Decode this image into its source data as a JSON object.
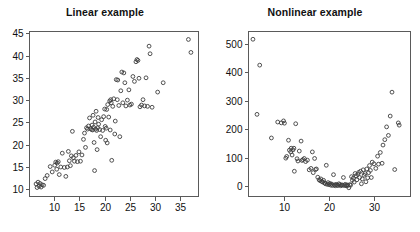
{
  "figure": {
    "width": 420,
    "height": 232,
    "background": "#ffffff",
    "marker_color": "#3d3d3d",
    "axis_color": "#5a5a5a",
    "text_color": "#111111"
  },
  "panels": [
    {
      "id": "linear",
      "title": "Linear example"
    },
    {
      "id": "nonlinear",
      "title": "Nonlinear example"
    }
  ],
  "chart_data": [
    {
      "type": "scatter",
      "title": "Linear example",
      "xlabel": "",
      "ylabel": "",
      "marker": "open-circle",
      "grid": false,
      "legend": null,
      "xlim": [
        5.0,
        38.5
      ],
      "ylim": [
        8.5,
        45.5
      ],
      "xticks": [
        10,
        15,
        20,
        25,
        30,
        35
      ],
      "yticks": [
        10,
        15,
        20,
        25,
        30,
        35,
        40,
        45
      ],
      "xtick_labels": [
        "10",
        "15",
        "20",
        "25",
        "30",
        "35"
      ],
      "ytick_labels": [
        "10",
        "15",
        "20",
        "25",
        "30",
        "35",
        "40",
        "45"
      ],
      "points": [
        [
          6.4,
          11.2
        ],
        [
          6.6,
          10.4
        ],
        [
          6.8,
          11.6
        ],
        [
          7.0,
          10.7
        ],
        [
          7.2,
          11.3
        ],
        [
          7.4,
          10.5
        ],
        [
          7.6,
          11.0
        ],
        [
          7.9,
          10.9
        ],
        [
          8.2,
          12.4
        ],
        [
          8.6,
          13.1
        ],
        [
          9.2,
          15.1
        ],
        [
          9.6,
          13.9
        ],
        [
          10.1,
          15.4
        ],
        [
          10.3,
          16.1
        ],
        [
          10.5,
          14.5
        ],
        [
          10.6,
          15.9
        ],
        [
          10.8,
          16.2
        ],
        [
          11.0,
          13.3
        ],
        [
          11.3,
          15.0
        ],
        [
          11.6,
          18.1
        ],
        [
          12.0,
          14.9
        ],
        [
          12.3,
          12.9
        ],
        [
          12.6,
          15.0
        ],
        [
          12.8,
          18.5
        ],
        [
          13.0,
          16.4
        ],
        [
          13.2,
          15.3
        ],
        [
          13.4,
          17.5
        ],
        [
          13.6,
          23.0
        ],
        [
          13.8,
          17.1
        ],
        [
          14.0,
          16.3
        ],
        [
          14.3,
          17.6
        ],
        [
          14.6,
          16.2
        ],
        [
          14.9,
          18.4
        ],
        [
          15.2,
          16.3
        ],
        [
          15.5,
          17.7
        ],
        [
          15.8,
          21.2
        ],
        [
          16.0,
          22.6
        ],
        [
          16.2,
          19.4
        ],
        [
          16.4,
          23.8
        ],
        [
          16.6,
          23.5
        ],
        [
          16.8,
          24.2
        ],
        [
          17.0,
          26.0
        ],
        [
          17.2,
          23.6
        ],
        [
          17.4,
          23.4
        ],
        [
          17.5,
          24.4
        ],
        [
          17.6,
          23.3
        ],
        [
          17.7,
          26.6
        ],
        [
          17.8,
          23.9
        ],
        [
          17.9,
          20.5
        ],
        [
          18.0,
          14.2
        ],
        [
          18.1,
          25.1
        ],
        [
          18.2,
          23.5
        ],
        [
          18.3,
          27.5
        ],
        [
          18.4,
          23.2
        ],
        [
          18.5,
          18.9
        ],
        [
          18.6,
          23.8
        ],
        [
          18.7,
          26.1
        ],
        [
          18.8,
          24.6
        ],
        [
          19.0,
          23.4
        ],
        [
          19.2,
          21.8
        ],
        [
          19.4,
          25.6
        ],
        [
          19.6,
          23.2
        ],
        [
          19.8,
          26.3
        ],
        [
          20.0,
          28.0
        ],
        [
          20.1,
          24.1
        ],
        [
          20.2,
          21.0
        ],
        [
          20.3,
          23.7
        ],
        [
          20.4,
          27.9
        ],
        [
          20.5,
          20.4
        ],
        [
          20.6,
          29.0
        ],
        [
          20.8,
          26.2
        ],
        [
          21.0,
          29.8
        ],
        [
          21.1,
          23.3
        ],
        [
          21.2,
          30.1
        ],
        [
          21.3,
          29.4
        ],
        [
          21.4,
          16.5
        ],
        [
          21.6,
          28.6
        ],
        [
          21.8,
          30.3
        ],
        [
          22.0,
          22.4
        ],
        [
          22.1,
          25.3
        ],
        [
          22.3,
          34.6
        ],
        [
          22.5,
          30.1
        ],
        [
          22.6,
          34.5
        ],
        [
          22.8,
          28.8
        ],
        [
          23.0,
          21.8
        ],
        [
          23.2,
          32.1
        ],
        [
          23.4,
          36.3
        ],
        [
          23.6,
          29.4
        ],
        [
          23.8,
          36.1
        ],
        [
          24.0,
          33.9
        ],
        [
          24.2,
          28.7
        ],
        [
          24.5,
          30.0
        ],
        [
          24.8,
          32.3
        ],
        [
          25.0,
          28.9
        ],
        [
          25.3,
          29.1
        ],
        [
          25.6,
          35.3
        ],
        [
          25.9,
          34.2
        ],
        [
          26.2,
          38.6
        ],
        [
          26.4,
          39.1
        ],
        [
          26.6,
          38.9
        ],
        [
          26.8,
          34.9
        ],
        [
          27.0,
          28.5
        ],
        [
          27.3,
          28.9
        ],
        [
          27.6,
          30.1
        ],
        [
          27.9,
          28.7
        ],
        [
          28.2,
          35.0
        ],
        [
          28.5,
          28.6
        ],
        [
          28.8,
          42.1
        ],
        [
          29.0,
          40.4
        ],
        [
          29.4,
          28.4
        ],
        [
          30.5,
          31.8
        ],
        [
          31.6,
          33.9
        ],
        [
          36.6,
          43.6
        ],
        [
          37.1,
          40.7
        ]
      ]
    },
    {
      "type": "scatter",
      "title": "Nonlinear example",
      "xlabel": "",
      "ylabel": "",
      "marker": "open-circle",
      "grid": false,
      "legend": null,
      "xlim": [
        2.0,
        38.0
      ],
      "ylim": [
        -35,
        545
      ],
      "xticks": [
        10,
        20,
        30
      ],
      "yticks": [
        0,
        100,
        200,
        300,
        400,
        500
      ],
      "xtick_labels": [
        "10",
        "20",
        "30"
      ],
      "ytick_labels": [
        "0",
        "100",
        "200",
        "300",
        "400",
        "500"
      ],
      "points": [
        [
          3.1,
          516
        ],
        [
          4.6,
          425
        ],
        [
          4.0,
          252
        ],
        [
          7.2,
          169
        ],
        [
          8.6,
          225
        ],
        [
          9.4,
          222
        ],
        [
          9.9,
          229
        ],
        [
          10.1,
          221
        ],
        [
          10.4,
          98
        ],
        [
          10.6,
          104
        ],
        [
          11.0,
          161
        ],
        [
          11.2,
          126
        ],
        [
          11.5,
          120
        ],
        [
          11.6,
          133
        ],
        [
          11.8,
          109
        ],
        [
          12.0,
          127
        ],
        [
          12.2,
          133
        ],
        [
          12.3,
          52
        ],
        [
          12.6,
          219
        ],
        [
          12.9,
          96
        ],
        [
          13.1,
          88
        ],
        [
          13.4,
          123
        ],
        [
          13.8,
          158
        ],
        [
          14.0,
          90
        ],
        [
          14.2,
          93
        ],
        [
          14.5,
          97
        ],
        [
          14.8,
          86
        ],
        [
          15.2,
          91
        ],
        [
          15.6,
          57
        ],
        [
          16.0,
          62
        ],
        [
          16.3,
          120
        ],
        [
          16.5,
          47
        ],
        [
          16.8,
          97
        ],
        [
          17.0,
          58
        ],
        [
          17.2,
          60
        ],
        [
          17.5,
          31
        ],
        [
          17.8,
          22
        ],
        [
          18.0,
          19
        ],
        [
          18.2,
          25
        ],
        [
          18.4,
          16
        ],
        [
          18.6,
          14
        ],
        [
          18.8,
          20
        ],
        [
          19.0,
          11
        ],
        [
          19.2,
          8
        ],
        [
          19.4,
          73
        ],
        [
          19.6,
          6
        ],
        [
          19.8,
          12
        ],
        [
          20.0,
          5
        ],
        [
          20.2,
          9
        ],
        [
          20.4,
          3
        ],
        [
          20.6,
          7
        ],
        [
          20.8,
          2
        ],
        [
          21.0,
          40
        ],
        [
          21.2,
          4
        ],
        [
          21.4,
          1
        ],
        [
          21.6,
          6
        ],
        [
          21.8,
          3
        ],
        [
          22.0,
          2
        ],
        [
          22.2,
          8
        ],
        [
          22.4,
          5
        ],
        [
          22.6,
          1
        ],
        [
          22.8,
          4
        ],
        [
          23.0,
          3
        ],
        [
          23.2,
          30
        ],
        [
          23.4,
          2
        ],
        [
          23.6,
          6
        ],
        [
          23.8,
          1
        ],
        [
          24.0,
          4
        ],
        [
          24.2,
          2
        ],
        [
          24.4,
          -6
        ],
        [
          24.6,
          5
        ],
        [
          24.8,
          3
        ],
        [
          25.0,
          33
        ],
        [
          25.2,
          20
        ],
        [
          25.4,
          28
        ],
        [
          25.6,
          14
        ],
        [
          25.8,
          44
        ],
        [
          26.0,
          36
        ],
        [
          26.2,
          22
        ],
        [
          26.4,
          41
        ],
        [
          26.6,
          48
        ],
        [
          26.8,
          30
        ],
        [
          27.0,
          52
        ],
        [
          27.2,
          8
        ],
        [
          27.4,
          25
        ],
        [
          27.6,
          57
        ],
        [
          27.8,
          38
        ],
        [
          28.0,
          44
        ],
        [
          28.2,
          15
        ],
        [
          28.4,
          60
        ],
        [
          28.6,
          29
        ],
        [
          28.8,
          47
        ],
        [
          29.0,
          72
        ],
        [
          29.2,
          55
        ],
        [
          29.4,
          30
        ],
        [
          29.6,
          84
        ],
        [
          30.0,
          78
        ],
        [
          30.4,
          62
        ],
        [
          30.8,
          105
        ],
        [
          31.0,
          77
        ],
        [
          31.4,
          118
        ],
        [
          31.8,
          80
        ],
        [
          32.0,
          144
        ],
        [
          32.4,
          163
        ],
        [
          32.8,
          208
        ],
        [
          33.2,
          178
        ],
        [
          33.6,
          246
        ],
        [
          34.0,
          330
        ],
        [
          34.6,
          58
        ],
        [
          35.4,
          222
        ],
        [
          35.6,
          214
        ]
      ]
    }
  ]
}
